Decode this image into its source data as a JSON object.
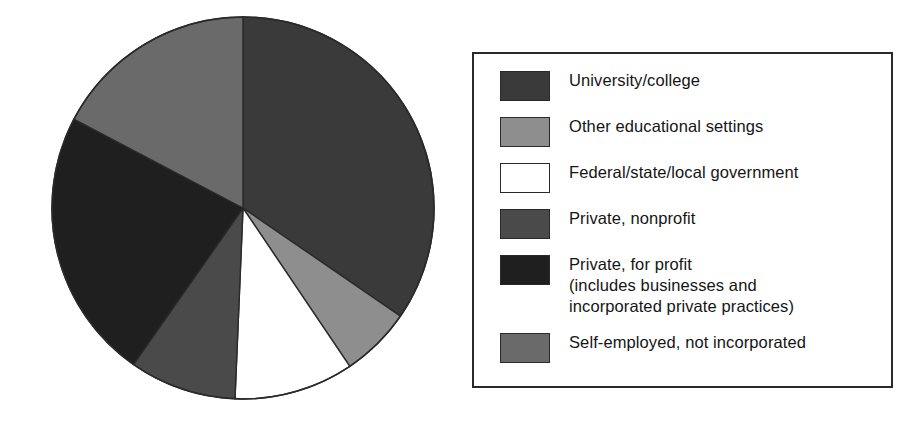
{
  "figure": {
    "background": "#ffffff",
    "outline_color": "#2a2a2a"
  },
  "legend": {
    "position": "right",
    "border_color": "#2a2a2a",
    "items": [
      {
        "label": "University/college",
        "color": "#3a3a3a"
      },
      {
        "label": "Other educational settings",
        "color": "#8e8e8e"
      },
      {
        "label": "Federal/state/local government",
        "color": "#ffffff"
      },
      {
        "label": "Private, nonprofit",
        "color": "#4a4a4a"
      },
      {
        "label": "Private, for profit\n(includes businesses and\nincorporated private practices)",
        "color": "#1f1f1f"
      },
      {
        "label": "Self-employed, not incorporated",
        "color": "#6a6a6a"
      }
    ]
  },
  "chart_data": {
    "type": "pie",
    "title": "",
    "xlabel": "",
    "ylabel": "",
    "start_angle_deg": 0,
    "direction": "clockwise",
    "legend_position": "right",
    "grid": false,
    "categories": [
      "University/college",
      "Other educational settings",
      "Federal/state/local government",
      "Private, nonprofit",
      "Private, for profit (includes businesses and incorporated private practices)",
      "Self-employed, not incorporated"
    ],
    "values": [
      34.6,
      6.0,
      10.1,
      9.1,
      23.0,
      17.3
    ],
    "units": "percent",
    "colors": [
      "#3a3a3a",
      "#8e8e8e",
      "#ffffff",
      "#4a4a4a",
      "#1f1f1f",
      "#6a6a6a"
    ],
    "slice_angles_deg": [
      {
        "category": "University/college",
        "start": 0.0,
        "end": 124.5
      },
      {
        "category": "Other educational settings",
        "start": 124.5,
        "end": 146.0
      },
      {
        "category": "Federal/state/local government",
        "start": 146.0,
        "end": 182.4
      },
      {
        "category": "Private, nonprofit",
        "start": 182.4,
        "end": 215.0
      },
      {
        "category": "Private, for profit",
        "start": 215.0,
        "end": 297.7
      },
      {
        "category": "Self-employed, not incorporated",
        "start": 297.7,
        "end": 360.0
      }
    ]
  }
}
